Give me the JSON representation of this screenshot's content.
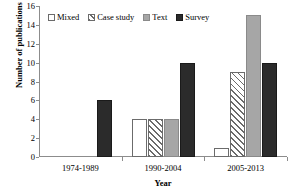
{
  "chart_data": {
    "type": "bar",
    "title": "",
    "xlabel": "Year",
    "ylabel": "Number of publications",
    "categories": [
      "1974-1989",
      "1990-2004",
      "2005-2013"
    ],
    "series": [
      {
        "name": "Mixed",
        "values": [
          0,
          4,
          1
        ],
        "color": "#ffffff",
        "pattern": "solid-white"
      },
      {
        "name": "Case study",
        "values": [
          0,
          4,
          9
        ],
        "color": "#ffffff",
        "pattern": "diagonal-hatch"
      },
      {
        "name": "Text",
        "values": [
          0,
          4,
          15
        ],
        "color": "#a6a6a6",
        "pattern": "solid-gray"
      },
      {
        "name": "Survey",
        "values": [
          6,
          10,
          10
        ],
        "color": "#2b2b2b",
        "pattern": "solid-black"
      }
    ],
    "ylim": [
      0,
      16
    ],
    "yticks": [
      0,
      2,
      4,
      6,
      8,
      10,
      12,
      14,
      16
    ],
    "ytick_labels": [
      "0",
      "2",
      "4",
      "6",
      "8",
      "10",
      "12",
      "14",
      "16"
    ],
    "grid": false,
    "legend_position": "top-left-inside"
  },
  "legend": {
    "items": [
      {
        "label": "Mixed"
      },
      {
        "label": "Case study"
      },
      {
        "label": "Text"
      },
      {
        "label": "Survey"
      }
    ]
  },
  "axes": {
    "y_title": "Number of publications",
    "x_title": "Year"
  }
}
